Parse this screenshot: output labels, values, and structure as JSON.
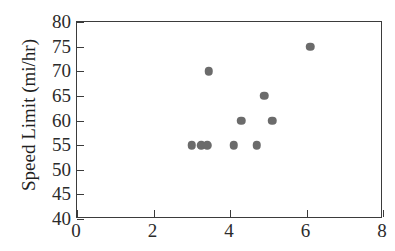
{
  "chart_data": {
    "type": "scatter",
    "title": "",
    "xlabel": "",
    "ylabel": "Speed Limit (mi/hr)",
    "xlim": [
      0,
      8
    ],
    "ylim": [
      40,
      80
    ],
    "xticks": [
      0,
      2,
      4,
      6,
      8
    ],
    "yticks": [
      40,
      45,
      50,
      55,
      60,
      65,
      70,
      75,
      80
    ],
    "xtick_labels": [
      "0",
      "2",
      "4",
      "6",
      "8"
    ],
    "ytick_labels": [
      "40",
      "45",
      "50",
      "55",
      "60",
      "65",
      "70",
      "75",
      "80"
    ],
    "grid": false,
    "legend": null,
    "marker_color": "#6b6b6b",
    "axis_color": "#3b3b3b",
    "points": [
      {
        "x": 3.0,
        "y": 55
      },
      {
        "x": 3.25,
        "y": 55
      },
      {
        "x": 3.4,
        "y": 55
      },
      {
        "x": 3.45,
        "y": 70
      },
      {
        "x": 4.1,
        "y": 55
      },
      {
        "x": 4.3,
        "y": 60
      },
      {
        "x": 4.7,
        "y": 55
      },
      {
        "x": 4.9,
        "y": 65
      },
      {
        "x": 5.1,
        "y": 60
      },
      {
        "x": 6.1,
        "y": 75
      }
    ]
  }
}
